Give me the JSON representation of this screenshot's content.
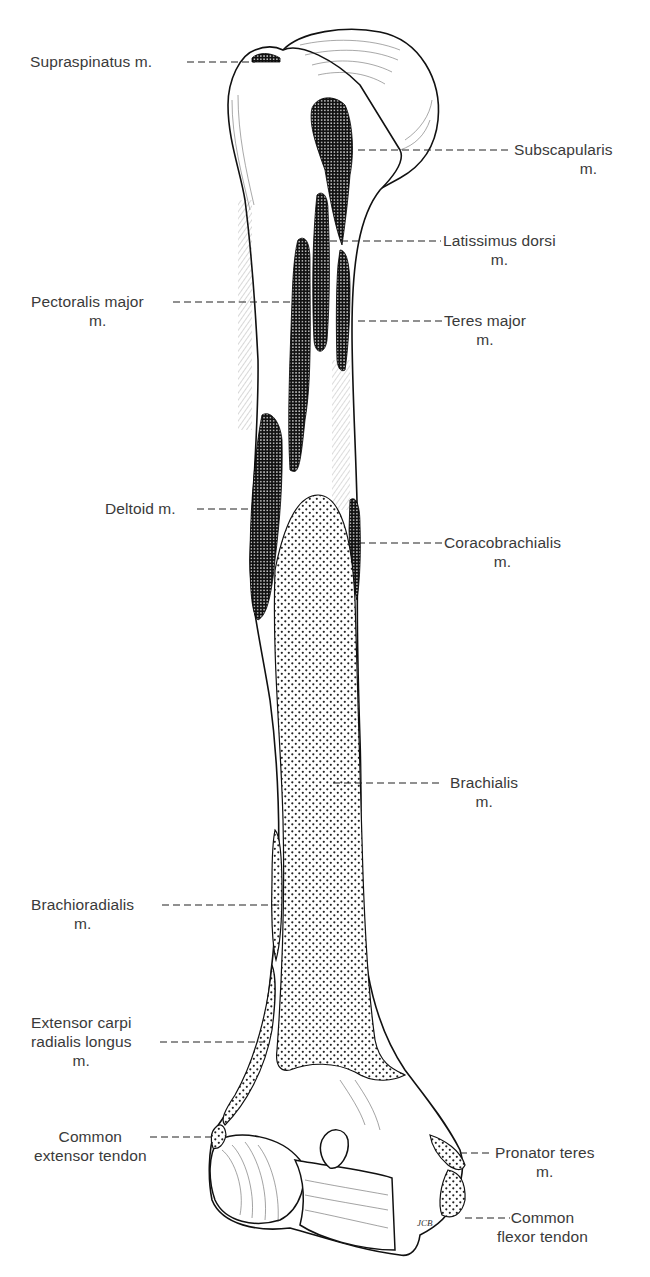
{
  "figure": {
    "colors": {
      "ink": "#111111",
      "label": "#3a3a3a",
      "background": "#ffffff"
    },
    "fill_legend": {
      "dense_crosshatch": "origin-type attachment (dark grid)",
      "dot_stipple": "insertion-type attachment (dotted)"
    },
    "artist_initials": "JCB"
  },
  "labels": {
    "supraspinatus": {
      "line1": "Supraspinatus m.",
      "line2": ""
    },
    "subscapularis": {
      "line1": "Subscapularis",
      "line2": "m."
    },
    "latissimus_dorsi": {
      "line1": "Latissimus dorsi",
      "line2": "m."
    },
    "pectoralis_major": {
      "line1": "Pectoralis major",
      "line2": "m."
    },
    "teres_major": {
      "line1": "Teres major",
      "line2": "m."
    },
    "deltoid": {
      "line1": "Deltoid m.",
      "line2": ""
    },
    "coracobrachialis": {
      "line1": "Coracobrachialis",
      "line2": "m."
    },
    "brachialis": {
      "line1": "Brachialis",
      "line2": "m."
    },
    "brachioradialis": {
      "line1": "Brachioradialis",
      "line2": "m."
    },
    "extensor_carpi_radialis_longus": {
      "line1": "Extensor carpi",
      "line2": "radialis longus",
      "line3": "m."
    },
    "common_extensor_tendon": {
      "line1": "Common",
      "line2": "extensor tendon"
    },
    "pronator_teres": {
      "line1": "Pronator teres",
      "line2": "m."
    },
    "common_flexor_tendon": {
      "line1": "Common",
      "line2": "flexor tendon"
    }
  }
}
